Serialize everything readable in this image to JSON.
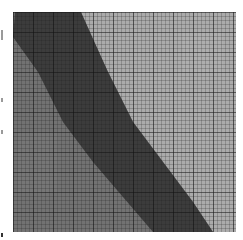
{
  "image": {
    "description": "Grayscale square grid with a dark diagonal band",
    "colors": {
      "background": "#ffffff",
      "left_region": "#6e6e6e",
      "band": "#3a3a3a",
      "right_region": "#a8a8a8",
      "fine_grid": "#2a2a2a",
      "major_grid": "#111111"
    },
    "grid": {
      "x": 13,
      "y": 12,
      "width": 223,
      "height": 220,
      "fine_step": 4,
      "major_step": 20
    },
    "band": {
      "top_left_x": 2,
      "top_right_x": 68,
      "bottom_left_x": 138,
      "bottom_right_x": 200
    }
  }
}
